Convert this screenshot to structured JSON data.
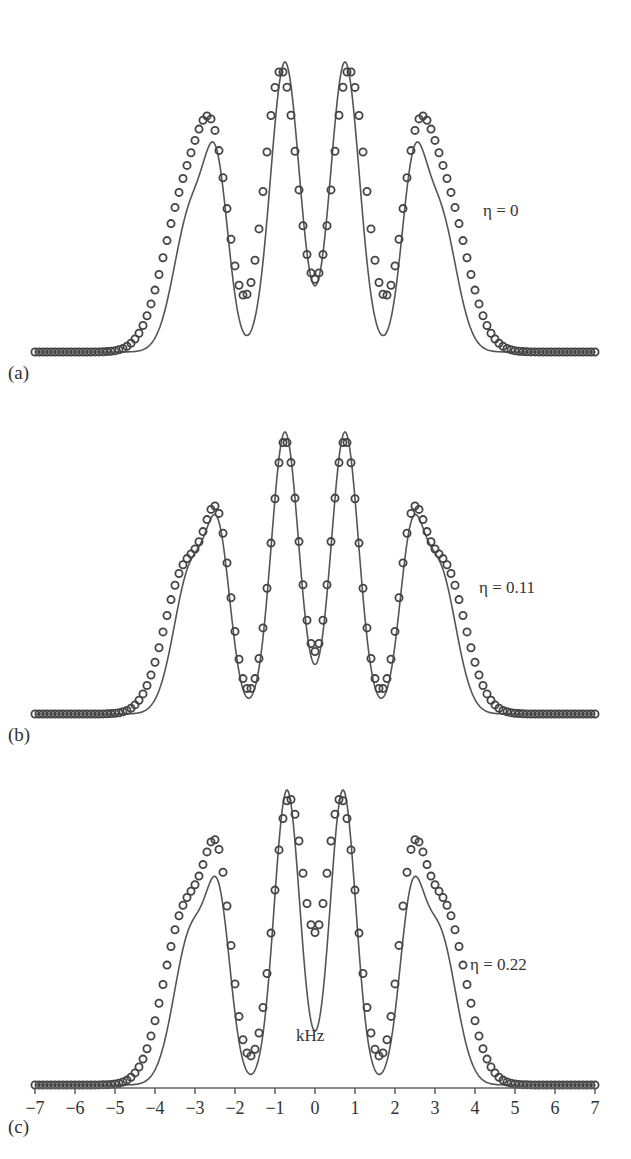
{
  "figure": {
    "x_axis": {
      "label": "kHz",
      "min": -7,
      "max": 7,
      "ticks": [
        -7,
        -6,
        -5,
        -4,
        -3,
        -2,
        -1,
        0,
        1,
        2,
        3,
        4,
        5,
        6,
        7
      ],
      "tick_labels": [
        "−7",
        "−6",
        "−5",
        "−4",
        "−3",
        "−2",
        "−1",
        "0",
        "1",
        "2",
        "3",
        "4",
        "5",
        "6",
        "7"
      ]
    },
    "panels": [
      {
        "label": "(a)",
        "eta_label": "η = 0"
      },
      {
        "label": "(b)",
        "eta_label": "η = 0.11"
      },
      {
        "label": "(c)",
        "eta_label": "η = 0.22"
      }
    ],
    "colors": {
      "line": "#555555",
      "markers": "#444444",
      "text": "#333333"
    }
  },
  "chart_data": [
    {
      "type": "line",
      "title": "(a) η = 0",
      "xlabel": "kHz",
      "ylabel": "",
      "xlim": [
        -7,
        7
      ],
      "grid": false,
      "series": [
        {
          "name": "experimental (solid line)",
          "style": "line",
          "x": [
            -7,
            -4,
            -3.5,
            -3,
            -2.6,
            -2.4,
            -1.8,
            -1.2,
            -0.75,
            0,
            0.75,
            1.2,
            1.8,
            2.4,
            2.6,
            3,
            3.5,
            4,
            7
          ],
          "y": [
            0,
            0.02,
            0.2,
            0.55,
            0.7,
            0.74,
            0.56,
            0.85,
            1.0,
            0.73,
            1.0,
            0.85,
            0.56,
            0.74,
            0.7,
            0.55,
            0.2,
            0.02,
            0
          ]
        },
        {
          "name": "simulated (circles)",
          "style": "markers",
          "x": [
            -7,
            -4.5,
            -4,
            -3.5,
            -3,
            -2.5,
            -1.8,
            -1.2,
            -0.85,
            0,
            0.85,
            1.2,
            1.8,
            2.5,
            3,
            3.5,
            4,
            4.5,
            7
          ],
          "y": [
            0,
            0.02,
            0.1,
            0.3,
            0.6,
            0.71,
            0.62,
            0.85,
            0.97,
            0.63,
            0.97,
            0.85,
            0.62,
            0.71,
            0.6,
            0.3,
            0.1,
            0.02,
            0
          ]
        }
      ]
    },
    {
      "type": "line",
      "title": "(b) η = 0.11",
      "xlabel": "kHz",
      "ylabel": "",
      "xlim": [
        -7,
        7
      ],
      "grid": false,
      "series": [
        {
          "name": "experimental (solid line)",
          "style": "line",
          "x": [
            -7,
            -4,
            -3.5,
            -3,
            -2.4,
            -1.8,
            -0.75,
            0,
            0.75,
            1.8,
            2.4,
            3,
            3.5,
            4,
            7
          ],
          "y": [
            0,
            0.02,
            0.2,
            0.55,
            0.7,
            0.55,
            1.0,
            0.57,
            1.0,
            0.55,
            0.7,
            0.55,
            0.2,
            0.02,
            0
          ]
        },
        {
          "name": "simulated (circles)",
          "style": "markers",
          "x": [
            -7,
            -4.5,
            -4,
            -3.5,
            -3,
            -2.4,
            -1.8,
            -0.75,
            0,
            0.75,
            1.8,
            2.4,
            3,
            3.5,
            4,
            4.5,
            7
          ],
          "y": [
            0,
            0.02,
            0.1,
            0.3,
            0.6,
            0.69,
            0.55,
            1.0,
            0.57,
            1.0,
            0.55,
            0.69,
            0.6,
            0.3,
            0.1,
            0.02,
            0
          ]
        }
      ]
    },
    {
      "type": "line",
      "title": "(c) η = 0.22",
      "xlabel": "kHz",
      "ylabel": "",
      "xlim": [
        -7,
        7
      ],
      "grid": false,
      "series": [
        {
          "name": "experimental (solid line)",
          "style": "line",
          "x": [
            -7,
            -4,
            -3.5,
            -3,
            -2.4,
            -1.8,
            -0.7,
            0,
            0.7,
            1.8,
            2.4,
            3,
            3.5,
            4,
            7
          ],
          "y": [
            0,
            0.02,
            0.2,
            0.55,
            0.7,
            0.51,
            1.0,
            0.72,
            1.0,
            0.51,
            0.7,
            0.55,
            0.2,
            0.02,
            0
          ]
        },
        {
          "name": "simulated (circles)",
          "style": "markers",
          "x": [
            -7,
            -4.5,
            -4,
            -3.5,
            -3,
            -2.4,
            -1.8,
            -0.7,
            0,
            0.7,
            1.8,
            2.4,
            3,
            3.5,
            4,
            4.5,
            7
          ],
          "y": [
            0,
            0.02,
            0.1,
            0.3,
            0.6,
            0.69,
            0.52,
            1.0,
            0.82,
            1.0,
            0.52,
            0.69,
            0.6,
            0.3,
            0.1,
            0.02,
            0
          ]
        }
      ]
    }
  ],
  "render_model": {
    "panels": [
      {
        "baseline_y": 352,
        "height": 290,
        "label_y": 362,
        "eta_x": 483,
        "eta_y": 203,
        "line": {
          "peaks": [
            [
              -2.45,
              0.55,
              0.3
            ],
            [
              -0.75,
              1.0,
              0.36
            ],
            [
              0.75,
              1.0,
              0.36
            ],
            [
              2.45,
              0.55,
              0.3
            ],
            [
              -3.1,
              0.48,
              0.42
            ],
            [
              3.1,
              0.48,
              0.42
            ]
          ]
        },
        "markers": {
          "peaks": [
            [
              -2.5,
              0.45,
              0.38
            ],
            [
              -0.85,
              0.88,
              0.42
            ],
            [
              0.85,
              0.88,
              0.42
            ],
            [
              2.5,
              0.45,
              0.38
            ],
            [
              -3.2,
              0.5,
              0.58
            ],
            [
              3.2,
              0.5,
              0.58
            ]
          ]
        }
      },
      {
        "baseline_y": 714,
        "height": 282,
        "label_y": 724,
        "eta_x": 479,
        "eta_y": 580,
        "line": {
          "peaks": [
            [
              -2.4,
              0.52,
              0.3
            ],
            [
              -0.75,
              0.94,
              0.34
            ],
            [
              0.75,
              0.94,
              0.34
            ],
            [
              2.4,
              0.52,
              0.3
            ],
            [
              -3.1,
              0.48,
              0.42
            ],
            [
              3.1,
              0.48,
              0.42
            ]
          ]
        },
        "markers": {
          "peaks": [
            [
              -2.4,
              0.5,
              0.32
            ],
            [
              -0.75,
              0.92,
              0.36
            ],
            [
              0.75,
              0.92,
              0.36
            ],
            [
              2.4,
              0.5,
              0.32
            ],
            [
              -3.2,
              0.5,
              0.55
            ],
            [
              3.2,
              0.5,
              0.55
            ]
          ]
        }
      },
      {
        "baseline_y": 1085,
        "height": 295,
        "label_y": 1112,
        "eta_x": 470,
        "eta_y": 960,
        "line": {
          "peaks": [
            [
              -2.4,
              0.52,
              0.3
            ],
            [
              -0.7,
              0.94,
              0.32
            ],
            [
              0.7,
              0.94,
              0.32
            ],
            [
              2.4,
              0.52,
              0.3
            ],
            [
              -3.1,
              0.48,
              0.42
            ],
            [
              3.1,
              0.48,
              0.42
            ]
          ]
        },
        "markers": {
          "peaks": [
            [
              -2.4,
              0.48,
              0.33
            ],
            [
              -0.65,
              0.8,
              0.4
            ],
            [
              0.65,
              0.8,
              0.4
            ],
            [
              2.4,
              0.48,
              0.33
            ],
            [
              -3.2,
              0.5,
              0.56
            ],
            [
              3.2,
              0.5,
              0.56
            ]
          ]
        }
      }
    ],
    "x0_px": 315,
    "px_per_khz": 40,
    "kHz_label_x": 308,
    "kHz_label_y": 1047,
    "tick_row_y": 1098
  }
}
